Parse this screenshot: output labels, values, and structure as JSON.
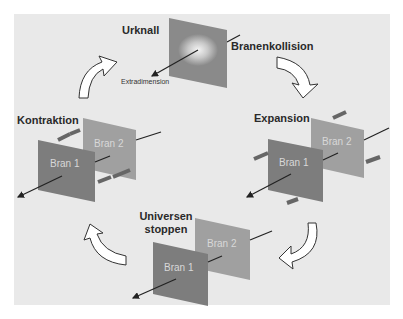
{
  "diagram": {
    "type": "cyclic-process",
    "colors": {
      "background": "#e9e9e9",
      "brane_front": "#7d7d7d",
      "brane_back": "#a0a0a0",
      "text": "#2a2a2a",
      "arrow_fill": "#ffffff"
    },
    "stages": [
      {
        "label": "Urknall",
        "sub_label": "Extradimension"
      },
      {
        "label": "Branenkollision"
      },
      {
        "label": "Expansion"
      },
      {
        "label": "Universen stoppen",
        "line1": "Universen",
        "line2": "stoppen"
      },
      {
        "label": "Kontraktion"
      }
    ],
    "branes": {
      "bran1": "Bran 1",
      "bran2": "Bran 2"
    }
  }
}
